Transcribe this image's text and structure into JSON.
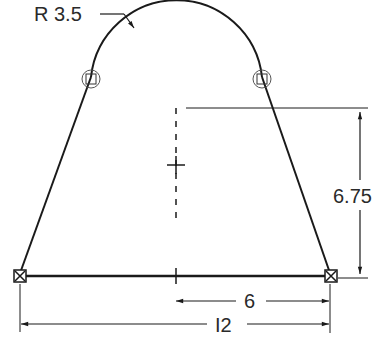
{
  "drawing": {
    "type": "sketch-profile",
    "dimensions": {
      "radius": "R 3.5",
      "height": "6.75",
      "half_width": "6",
      "width": "I2"
    },
    "colors": {
      "line": "#1a1a1a",
      "background": "#ffffff"
    }
  }
}
